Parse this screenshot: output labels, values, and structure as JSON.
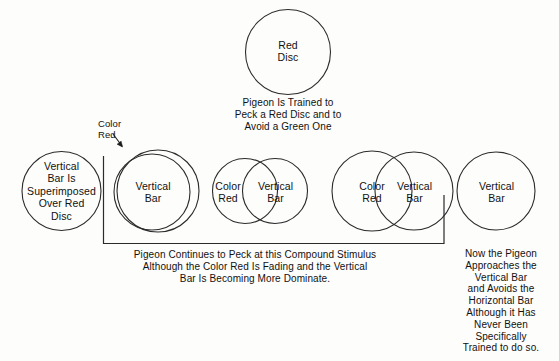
{
  "diagram": {
    "stroke_color": "#2b2b2b",
    "text_color": "#111111",
    "background": "#fdfdfc"
  },
  "top": {
    "disc_label": "Red\nDisc",
    "caption": "Pigeon Is Trained to\nPeck a Red Disc and to\nAvoid a Green One"
  },
  "annotation": {
    "color_red_pointer": "Color\nRed"
  },
  "stages": [
    {
      "name": "stage-1-superimposed",
      "circles": [
        {
          "name": "circle-vertical-bar-superimposed",
          "label": "Vertical\nBar Is\nSuperimposed\nOver Red\nDisc"
        }
      ]
    },
    {
      "name": "stage-2-nearly-coincident",
      "circles": [
        {
          "name": "circle-color-red-outer",
          "label": ""
        },
        {
          "name": "circle-vertical-bar",
          "label": "Vertical\nBar"
        }
      ]
    },
    {
      "name": "stage-3-heavy-overlap",
      "circles": [
        {
          "name": "circle-color-red",
          "label": "Color\nRed"
        },
        {
          "name": "circle-vertical-bar",
          "label": "Vertical\nBar"
        }
      ]
    },
    {
      "name": "stage-4-light-overlap",
      "circles": [
        {
          "name": "circle-color-red",
          "label": "Color\nRed"
        },
        {
          "name": "circle-vertical-bar",
          "label": "Vertical\nBar"
        }
      ]
    },
    {
      "name": "stage-5-vertical-bar-only",
      "circles": [
        {
          "name": "circle-vertical-bar-alone",
          "label": "Vertical\nBar"
        }
      ]
    }
  ],
  "captions": {
    "bracket_caption": "Pigeon Continues to Peck at this Compound Stimulus\nAlthough the Color Red  Is Fading and the Vertical\nBar Is Becoming More Dominate.",
    "right_caption": "Now the Pigeon\nApproaches the\nVertical Bar\nand Avoids the\nHorizontal Bar\nAlthough it Has\nNever Been\nSpecifically\nTrained to do so."
  }
}
